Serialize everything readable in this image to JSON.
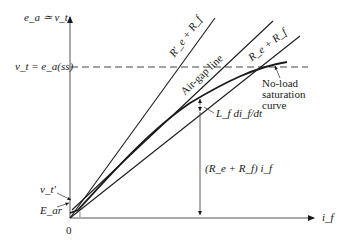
{
  "diagram": {
    "type": "dc-shunt-generator-voltage-buildup",
    "y_axis_label": "e_a ≃ v_t",
    "x_axis_label": "i_f",
    "origin_label": "0",
    "steady_state_label": "v_t = e_a(ss)",
    "lines": {
      "critical_resistance": "R'_e + R_f",
      "air_gap": "Air-gap line",
      "field_resistance": "R_e + R_f"
    },
    "curve_label": [
      "No-load",
      "saturation",
      "curve"
    ],
    "inductive_drop_label": "L_f di_f/dt",
    "resistive_drop_label": "(R_e + R_f) i_f",
    "vt_prime_label": "v_t'",
    "residual_label": "E_ar",
    "colors": {
      "line": "#1a1a1a",
      "dashed": "#444444",
      "background": "#ffffff"
    }
  }
}
